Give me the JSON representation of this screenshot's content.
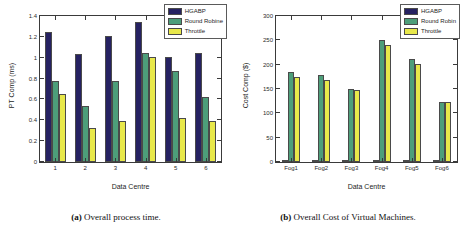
{
  "figure": {
    "panels": [
      {
        "caption_tag": "(a)",
        "caption_text": "Overall process time.",
        "chart_data": {
          "type": "bar",
          "title": "",
          "xlabel": "Data Centre",
          "ylabel": "PT Comp (ms)",
          "categories": [
            "1",
            "2",
            "3",
            "4",
            "5",
            "6"
          ],
          "yticks": [
            "0",
            "0.2",
            "0.4",
            "0.6",
            "0.8",
            "1",
            "1.2",
            "1.4"
          ],
          "ylim": [
            0,
            1.4
          ],
          "grid": false,
          "legend_position": "top-right",
          "series": [
            {
              "name": "HGABP",
              "color": "#262262",
              "values": [
                1.25,
                1.04,
                1.21,
                1.345,
                1.01,
                1.05
              ]
            },
            {
              "name": "Round Robine",
              "color": "#4d9e7a",
              "values": [
                0.78,
                0.54,
                0.78,
                1.05,
                0.87,
                0.62
              ]
            },
            {
              "name": "Throttle",
              "color": "#e8e84a",
              "values": [
                0.65,
                0.33,
                0.395,
                1.01,
                0.425,
                0.395
              ]
            }
          ]
        }
      },
      {
        "caption_tag": "(b)",
        "caption_text": "Overall Cost of Virtual Machines.",
        "chart_data": {
          "type": "bar",
          "title": "",
          "xlabel": "Data Centre",
          "ylabel": "Cost Comp ($)",
          "categories": [
            "Fog1",
            "Fog2",
            "Fog3",
            "Fog4",
            "Fog5",
            "Fog6"
          ],
          "yticks": [
            "0",
            "50",
            "100",
            "150",
            "200",
            "250",
            "300"
          ],
          "ylim": [
            0,
            300
          ],
          "grid": false,
          "legend_position": "top-right",
          "series": [
            {
              "name": "HGABP",
              "color": "#262262",
              "values": [
                4,
                4,
                3,
                5,
                4,
                3
              ]
            },
            {
              "name": "Round Robin",
              "color": "#4d9e7a",
              "values": [
                184,
                179,
                151,
                250,
                212,
                124
              ]
            },
            {
              "name": "Throttle",
              "color": "#e8e84a",
              "values": [
                175,
                169,
                149,
                241,
                202,
                123
              ]
            }
          ]
        }
      }
    ]
  }
}
